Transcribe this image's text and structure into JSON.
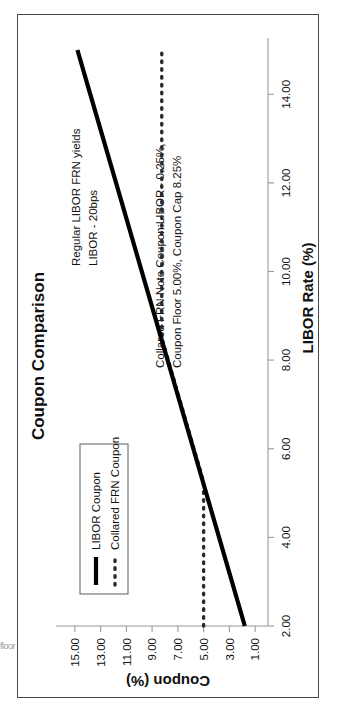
{
  "figure": {
    "title": "Coupon Comparison",
    "edge_artifact": "floor"
  },
  "annotations": {
    "regular": "Regular LIBOR FRN  yields",
    "regular2": "LIBOR - 20bps",
    "collared1": "Collared FRN Note Coupon:LIBOR - 0.25%,",
    "collared2": "Coupon Floor 5.00%, Coupon Cap 8.25%"
  },
  "legend": {
    "items": [
      {
        "label": "LIBOR Coupon",
        "style": "solid",
        "color": "#000000"
      },
      {
        "label": "Collared FRN Coupon",
        "style": "dotted",
        "color": "#2b2b2b"
      }
    ]
  },
  "chart_data": {
    "type": "line",
    "title": "Coupon Comparison",
    "xlabel": "LIBOR Rate (%)",
    "ylabel": "Coupon (%)",
    "xlim": [
      2.0,
      15.0
    ],
    "ylim": [
      0.0,
      16.0
    ],
    "grid": false,
    "legend_position": "left-inside",
    "xticks": [
      "2.00",
      "4.00",
      "6.00",
      "8.00",
      "10.00",
      "12.00",
      "14.00"
    ],
    "xtick_values": [
      2.0,
      4.0,
      6.0,
      8.0,
      10.0,
      12.0,
      14.0
    ],
    "yticks": [
      "1.00",
      "3.00",
      "5.00",
      "7.00",
      "9.00",
      "11.00",
      "13.00",
      "15.00"
    ],
    "ytick_values": [
      1.0,
      3.0,
      5.0,
      7.0,
      9.0,
      11.0,
      13.0,
      15.0
    ],
    "series": [
      {
        "name": "LIBOR Coupon",
        "style": "solid",
        "formula": "LIBOR - 0.20",
        "x": [
          2.0,
          4.0,
          6.0,
          8.0,
          10.0,
          12.0,
          14.0,
          15.0
        ],
        "values": [
          1.8,
          3.8,
          5.8,
          7.8,
          9.8,
          11.8,
          13.8,
          14.8
        ]
      },
      {
        "name": "Collared FRN Coupon",
        "style": "dotted",
        "formula": "min(max(LIBOR - 0.25, 5.00), 8.25)",
        "floor": 5.0,
        "cap": 8.25,
        "x": [
          2.0,
          3.0,
          4.0,
          5.0,
          5.25,
          6.0,
          7.0,
          8.0,
          8.5,
          9.0,
          10.0,
          12.0,
          14.0,
          15.0
        ],
        "values": [
          5.0,
          5.0,
          5.0,
          5.0,
          5.0,
          5.75,
          6.75,
          7.75,
          8.25,
          8.25,
          8.25,
          8.25,
          8.25,
          8.25
        ]
      }
    ]
  }
}
